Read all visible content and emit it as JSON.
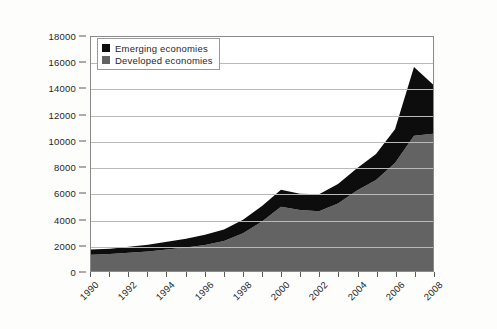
{
  "chart_data": {
    "type": "area",
    "title": "",
    "subtitle": "",
    "xlabel": "",
    "ylabel": "",
    "stacked": true,
    "grid": true,
    "legend_position": "top-left",
    "xlim": [
      1990,
      2008
    ],
    "ylim": [
      0,
      18000
    ],
    "ytick_labels": [
      "0",
      "2000",
      "4000",
      "6000",
      "8000",
      "10000",
      "12000",
      "14000",
      "16000",
      "18000"
    ],
    "ytick_values": [
      0,
      2000,
      4000,
      6000,
      8000,
      10000,
      12000,
      14000,
      16000,
      18000
    ],
    "xtick_labels": [
      "1990",
      "1992",
      "1994",
      "1996",
      "1998",
      "2000",
      "2002",
      "2004",
      "2006",
      "2008"
    ],
    "xtick_values": [
      1990,
      1992,
      1994,
      1996,
      1998,
      2000,
      2002,
      2004,
      2006,
      2008
    ],
    "x": [
      1990,
      1991,
      1992,
      1993,
      1994,
      1995,
      1996,
      1997,
      1998,
      1999,
      2000,
      2001,
      2002,
      2003,
      2004,
      2005,
      2006,
      2007,
      2008
    ],
    "series": [
      {
        "name": "Developed economies",
        "color": "#636363",
        "values": [
          1250,
          1300,
          1400,
          1500,
          1650,
          1800,
          2000,
          2300,
          2900,
          3800,
          4950,
          4700,
          4600,
          5200,
          6200,
          7000,
          8300,
          10400,
          10550
        ]
      },
      {
        "name": "Emerging economies",
        "color": "#0d0d0d",
        "values": [
          400,
          420,
          460,
          520,
          600,
          680,
          780,
          900,
          1050,
          1200,
          1300,
          1250,
          1300,
          1500,
          1700,
          2000,
          2600,
          5300,
          3800
        ]
      }
    ],
    "totals": [
      1650,
      1720,
      1860,
      2020,
      2250,
      2480,
      2780,
      3200,
      3950,
      5000,
      6250,
      5950,
      5900,
      6700,
      7900,
      9000,
      10900,
      15700,
      14350
    ]
  },
  "legend": {
    "entries": [
      {
        "label": "Emerging economies",
        "color": "#0d0d0d",
        "swatch": "legend-swatch-emerging"
      },
      {
        "label": "Developed economies",
        "color": "#636363",
        "swatch": "legend-swatch-developed"
      }
    ]
  },
  "colors": {
    "emerging": "#0d0d0d",
    "developed": "#636363",
    "gridline": "#b9b9b9",
    "axis": "#8a8a8a",
    "background": "#fdfdfc"
  }
}
